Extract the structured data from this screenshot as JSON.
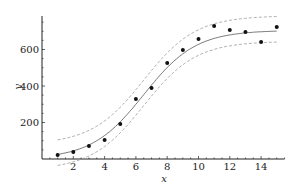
{
  "chart_data": {
    "type": "scatter",
    "title": "",
    "xlabel": "x",
    "ylabel": "y",
    "xlim": [
      0,
      15.5
    ],
    "ylim": [
      0,
      780
    ],
    "grid": false,
    "legend": null,
    "x_ticks": [
      2,
      4,
      6,
      8,
      10,
      12,
      14
    ],
    "y_ticks": [
      200,
      400,
      600
    ],
    "series": [
      {
        "name": "observations",
        "kind": "points",
        "x": [
          1,
          2,
          3,
          4,
          5,
          6,
          7,
          8,
          9,
          10,
          11,
          12,
          13,
          14,
          15
        ],
        "y": [
          22,
          38,
          71,
          104,
          192,
          329,
          389,
          526,
          597,
          658,
          729,
          707,
          696,
          641,
          723
        ]
      },
      {
        "name": "fit",
        "kind": "line",
        "style": "solid",
        "model": "logistic",
        "params": {
          "L": 705,
          "k": 0.6,
          "x0": 6.5
        },
        "x_range": [
          1,
          15
        ]
      },
      {
        "name": "upper band",
        "kind": "line",
        "style": "dashed",
        "offset": 80,
        "x_range": [
          1,
          15
        ]
      },
      {
        "name": "lower band",
        "kind": "line",
        "style": "dashed",
        "offset": -60,
        "x_range": [
          1,
          15
        ]
      }
    ]
  },
  "axes": {
    "x_label": "x",
    "y_label": "y",
    "x_tick_labels": [
      "2",
      "4",
      "6",
      "8",
      "10",
      "12",
      "14"
    ],
    "y_tick_labels": [
      "200",
      "400",
      "600"
    ]
  },
  "colors": {
    "points": "#111111",
    "fit": "#555555",
    "band": "#999999",
    "axis": "#222222"
  }
}
